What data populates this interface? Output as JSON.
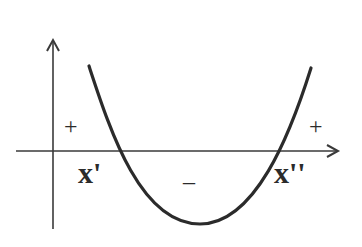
{
  "diagram": {
    "title": "",
    "type": "quadratic sign chart (parabola opening upward)",
    "colors": {
      "ink": "#2b2b2b",
      "background": "#ffffff"
    },
    "axes": {
      "x_axis": {
        "has_arrow": true
      },
      "y_axis": {
        "has_arrow": true
      }
    },
    "roots": [
      {
        "label": "x'"
      },
      {
        "label": "x''"
      }
    ],
    "signs": {
      "left_region": "+",
      "middle_region": "–",
      "right_region": "+"
    }
  }
}
